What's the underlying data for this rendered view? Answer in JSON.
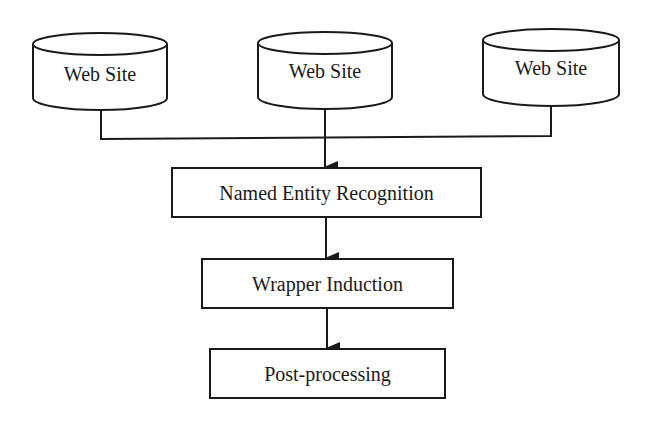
{
  "diagram": {
    "type": "flowchart",
    "colors": {
      "stroke": "#1a1a1a",
      "fill": "#ffffff",
      "background": "#ffffff"
    },
    "sources": [
      {
        "id": "web-site-1",
        "shape": "cylinder",
        "label": "Web Site"
      },
      {
        "id": "web-site-2",
        "shape": "cylinder",
        "label": "Web Site"
      },
      {
        "id": "web-site-3",
        "shape": "cylinder",
        "label": "Web Site"
      }
    ],
    "steps": [
      {
        "id": "named-entity-recognition",
        "shape": "rectangle",
        "label": "Named Entity Recognition"
      },
      {
        "id": "wrapper-induction",
        "shape": "rectangle",
        "label": "Wrapper Induction"
      },
      {
        "id": "post-processing",
        "shape": "rectangle",
        "label": "Post-processing"
      }
    ],
    "edges": [
      {
        "from": "web-site-1",
        "to": "named-entity-recognition"
      },
      {
        "from": "web-site-2",
        "to": "named-entity-recognition"
      },
      {
        "from": "web-site-3",
        "to": "named-entity-recognition"
      },
      {
        "from": "named-entity-recognition",
        "to": "wrapper-induction"
      },
      {
        "from": "wrapper-induction",
        "to": "post-processing"
      }
    ]
  }
}
